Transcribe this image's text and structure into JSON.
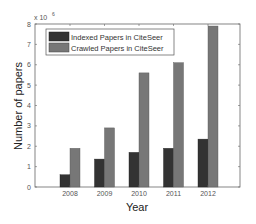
{
  "chart_data": {
    "type": "bar",
    "title": "",
    "xlabel": "Year",
    "ylabel": "Number of papers",
    "y_multiplier_label": "x10^6",
    "categories": [
      "2008",
      "2009",
      "2010",
      "2011",
      "2012"
    ],
    "series": [
      {
        "name": "Indexed Papers in CiteSeer",
        "color": "#333333",
        "values": [
          0.6,
          1.37,
          1.7,
          1.9,
          2.35
        ]
      },
      {
        "name": "Crawled Papers in CiteSeer",
        "color": "#777777",
        "values": [
          1.9,
          2.9,
          5.6,
          6.1,
          7.9
        ]
      }
    ],
    "ylim": [
      0,
      8
    ],
    "yticks": [
      "0",
      "1",
      "2",
      "3",
      "4",
      "5",
      "6",
      "7",
      "8"
    ],
    "grid": false,
    "legend_position": "upper left"
  },
  "axes": {
    "x_title": "Year",
    "y_title": "Number of papers",
    "exponent_base": "x 10",
    "exponent_power": "6"
  },
  "legend": {
    "items": [
      {
        "label": "Indexed Papers in CiteSeer",
        "color": "#333333"
      },
      {
        "label": "Crawled Papers in CiteSeer",
        "color": "#777777"
      }
    ]
  }
}
